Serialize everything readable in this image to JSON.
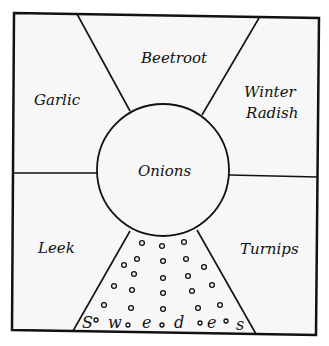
{
  "diagram": {
    "type": "garden-bed-layout",
    "center": {
      "label": "Onions"
    },
    "sections": [
      {
        "id": "top",
        "label": "Beetroot"
      },
      {
        "id": "top-left",
        "label": "Garlic"
      },
      {
        "id": "top-right",
        "label": "Winter",
        "label2": "Radish"
      },
      {
        "id": "bottom-left",
        "label": "Leek"
      },
      {
        "id": "bottom-right",
        "label": "Turnips"
      },
      {
        "id": "bottom",
        "label": "Sow seeds",
        "letters": [
          "S",
          "w",
          "e",
          "d",
          "e",
          "s"
        ]
      }
    ],
    "colors": {
      "ink": "#111111",
      "paper": "#ffffff"
    }
  }
}
